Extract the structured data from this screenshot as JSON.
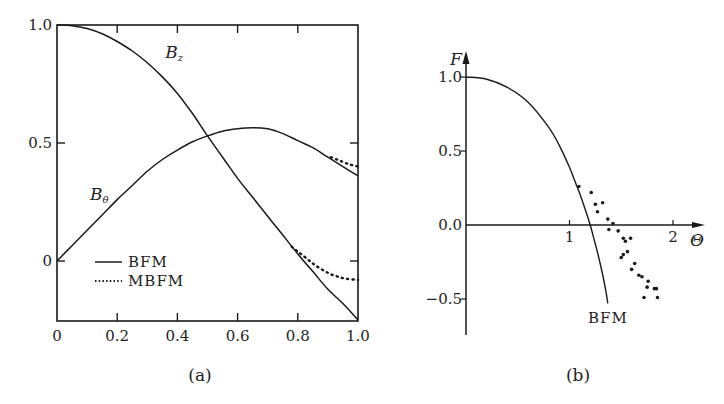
{
  "chart_data": [
    {
      "id": "a",
      "type": "line",
      "caption": "(a)",
      "title": "",
      "xlabel": "",
      "ylabel": "",
      "xlim": [
        0,
        1.0
      ],
      "ylim": [
        -0.25,
        1.0
      ],
      "xticks": [
        "0",
        "0.2",
        "0.4",
        "0.6",
        "0.8",
        "1.0"
      ],
      "xtick_values": [
        0,
        0.2,
        0.4,
        0.6,
        0.8,
        1.0
      ],
      "yticks": [
        "0",
        "0.5",
        "1.0"
      ],
      "ytick_values": [
        0,
        0.5,
        1.0
      ],
      "grid": false,
      "legend": {
        "position": "lower-left",
        "entries": [
          {
            "label": "BFM",
            "style": "solid"
          },
          {
            "label": "MBFM",
            "style": "dotted"
          }
        ]
      },
      "annotations": [
        {
          "text": "B",
          "sub": "z",
          "x": 0.36,
          "y": 0.86
        },
        {
          "text": "B",
          "sub": "θ",
          "x": 0.11,
          "y": 0.26
        }
      ],
      "series": [
        {
          "name": "B_z (BFM)",
          "style": "solid",
          "x": [
            0,
            0.05,
            0.1,
            0.15,
            0.2,
            0.25,
            0.3,
            0.35,
            0.4,
            0.45,
            0.5,
            0.55,
            0.6,
            0.65,
            0.7,
            0.75,
            0.8,
            0.85,
            0.9,
            0.95,
            1.0
          ],
          "y": [
            1.0,
            0.997,
            0.985,
            0.963,
            0.93,
            0.89,
            0.84,
            0.78,
            0.71,
            0.625,
            0.53,
            0.44,
            0.35,
            0.27,
            0.19,
            0.11,
            0.03,
            -0.045,
            -0.12,
            -0.18,
            -0.25
          ]
        },
        {
          "name": "B_θ (BFM)",
          "style": "solid",
          "x": [
            0,
            0.05,
            0.1,
            0.15,
            0.2,
            0.25,
            0.3,
            0.35,
            0.4,
            0.45,
            0.5,
            0.55,
            0.6,
            0.65,
            0.7,
            0.75,
            0.8,
            0.85,
            0.9,
            0.95,
            1.0
          ],
          "y": [
            0,
            0.065,
            0.13,
            0.195,
            0.26,
            0.32,
            0.38,
            0.43,
            0.47,
            0.505,
            0.53,
            0.55,
            0.56,
            0.565,
            0.56,
            0.54,
            0.51,
            0.48,
            0.44,
            0.4,
            0.36
          ]
        },
        {
          "name": "B_z (MBFM)",
          "style": "dotted",
          "x": [
            0.78,
            0.8,
            0.83,
            0.86,
            0.9,
            0.93,
            0.96,
            1.0
          ],
          "y": [
            0.06,
            0.04,
            0.01,
            -0.02,
            -0.05,
            -0.065,
            -0.075,
            -0.08
          ]
        },
        {
          "name": "B_θ (MBFM)",
          "style": "dotted",
          "x": [
            0.91,
            0.94,
            0.97,
            1.0
          ],
          "y": [
            0.44,
            0.425,
            0.41,
            0.4
          ]
        }
      ]
    },
    {
      "id": "b",
      "type": "scatter",
      "caption": "(b)",
      "title": "",
      "xlabel": "Θ",
      "ylabel": "F",
      "xlim": [
        0,
        2.3
      ],
      "ylim": [
        -0.75,
        1.15
      ],
      "xticks": [
        "1",
        "2"
      ],
      "xtick_values": [
        1,
        2
      ],
      "yticks": [
        "1.0",
        "0.5",
        "0.0",
        "−0.5"
      ],
      "ytick_values": [
        1.0,
        0.5,
        0.0,
        -0.5
      ],
      "grid": false,
      "annotations": [
        {
          "text": "BFM",
          "x": 1.38,
          "y": -0.62
        }
      ],
      "series": [
        {
          "name": "BFM",
          "style": "solid",
          "x": [
            0,
            0.2,
            0.4,
            0.6,
            0.8,
            0.9,
            1.0,
            1.05,
            1.1,
            1.15,
            1.2,
            1.25,
            1.3,
            1.35,
            1.37
          ],
          "y": [
            1.0,
            0.985,
            0.93,
            0.83,
            0.66,
            0.54,
            0.39,
            0.3,
            0.21,
            0.11,
            0.0,
            -0.13,
            -0.27,
            -0.44,
            -0.53
          ]
        },
        {
          "name": "data points",
          "style": "markers",
          "x": [
            1.09,
            1.21,
            1.25,
            1.32,
            1.27,
            1.37,
            1.38,
            1.42,
            1.52,
            1.47,
            1.59,
            1.54,
            1.52,
            1.5,
            1.56,
            1.63,
            1.6,
            1.67,
            1.7,
            1.75,
            1.76,
            1.82,
            1.72,
            1.85,
            1.84
          ],
          "y": [
            0.26,
            0.22,
            0.14,
            0.15,
            0.09,
            0.04,
            -0.03,
            0.01,
            -0.09,
            -0.04,
            -0.09,
            -0.11,
            -0.2,
            -0.22,
            -0.18,
            -0.26,
            -0.3,
            -0.34,
            -0.35,
            -0.42,
            -0.38,
            -0.43,
            -0.49,
            -0.49,
            -0.43
          ]
        }
      ]
    }
  ]
}
